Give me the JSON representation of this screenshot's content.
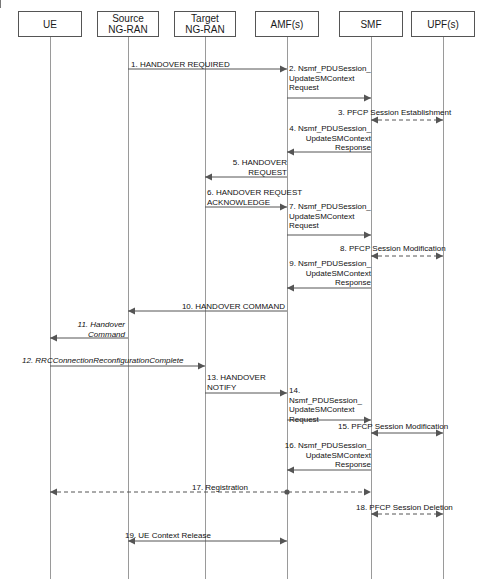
{
  "diagram": {
    "type": "sequence-diagram",
    "width": 491,
    "height": 579,
    "line_color": "#555555",
    "lifeline_color": "#9a9a9a",
    "text_color": "#111111"
  },
  "actors": [
    {
      "id": "ue",
      "label": "UE",
      "x": 50,
      "box_left": 18,
      "box_top": 11,
      "box_width": 64,
      "box_height": 26
    },
    {
      "id": "srcran",
      "label": "Source\nNG-RAN",
      "x": 128,
      "box_left": 97,
      "box_top": 11,
      "box_width": 62,
      "box_height": 26
    },
    {
      "id": "tgtran",
      "label": "Target\nNG-RAN",
      "x": 205,
      "box_left": 174,
      "box_top": 11,
      "box_width": 62,
      "box_height": 26
    },
    {
      "id": "amf",
      "label": "AMF(s)",
      "x": 287,
      "box_left": 255,
      "box_top": 11,
      "box_width": 64,
      "box_height": 26
    },
    {
      "id": "smf",
      "label": "SMF",
      "x": 371,
      "box_left": 339,
      "box_top": 11,
      "box_width": 64,
      "box_height": 26
    },
    {
      "id": "upf",
      "label": "UPF(s)",
      "x": 443,
      "box_left": 411,
      "box_top": 11,
      "box_width": 64,
      "box_height": 26
    }
  ],
  "messages": [
    {
      "seq": "1",
      "text": "1. HANDOVER REQUIRED",
      "from": "srcran",
      "to": "amf",
      "style": "solid",
      "direction": "forward",
      "arrow_y": 69,
      "label_x": 131,
      "label_y": 60,
      "label_w": 150,
      "label_align": "left",
      "italic": false
    },
    {
      "seq": "2",
      "text": "2. Nsmf_PDUSession_\nUpdateSMContext\nRequest",
      "from": "amf",
      "to": "smf",
      "style": "solid",
      "direction": "forward",
      "arrow_y": 98,
      "label_x": 289,
      "label_y": 64,
      "label_w": 82,
      "label_align": "left",
      "italic": false
    },
    {
      "seq": "3",
      "text": "3. PFCP Session Establishment",
      "from": "smf",
      "to": "upf",
      "style": "dashed",
      "direction": "both",
      "arrow_y": 120,
      "label_x": 338,
      "label_y": 108,
      "label_w": 150,
      "label_align": "left",
      "italic": false
    },
    {
      "seq": "4",
      "text": "4. Nsmf_PDUSession_\nUpdateSMContext\nResponse",
      "from": "smf",
      "to": "amf",
      "style": "solid",
      "direction": "backward",
      "arrow_y": 152,
      "label_x": 278,
      "label_y": 124,
      "label_w": 93,
      "label_align": "right",
      "italic": false
    },
    {
      "seq": "5",
      "text": "5. HANDOVER\nREQUEST",
      "from": "amf",
      "to": "tgtran",
      "style": "solid",
      "direction": "backward",
      "arrow_y": 177,
      "label_x": 207,
      "label_y": 158,
      "label_w": 80,
      "label_align": "right",
      "italic": false
    },
    {
      "seq": "6",
      "text": "6. HANDOVER REQUEST\nACKNOWLEDGE",
      "from": "tgtran",
      "to": "amf",
      "style": "solid",
      "direction": "forward",
      "arrow_y": 207,
      "label_x": 207,
      "label_y": 188,
      "label_w": 110,
      "label_align": "left",
      "italic": false
    },
    {
      "seq": "7",
      "text": "7. Nsmf_PDUSession_\nUpdateSMContext\nRequest",
      "from": "amf",
      "to": "smf",
      "style": "solid",
      "direction": "forward",
      "arrow_y": 235,
      "label_x": 289,
      "label_y": 202,
      "label_w": 84,
      "label_align": "left",
      "italic": false
    },
    {
      "seq": "8",
      "text": "8. PFCP Session Modification",
      "from": "smf",
      "to": "upf",
      "style": "dashed",
      "direction": "both",
      "arrow_y": 256,
      "label_x": 340,
      "label_y": 244,
      "label_w": 146,
      "label_align": "left",
      "italic": false
    },
    {
      "seq": "9",
      "text": "9. Nsmf_PDUSession_\nUpdateSMContext\nResponse",
      "from": "smf",
      "to": "amf",
      "style": "solid",
      "direction": "backward",
      "arrow_y": 288,
      "label_x": 278,
      "label_y": 259,
      "label_w": 93,
      "label_align": "right",
      "italic": false
    },
    {
      "seq": "10",
      "text": "10. HANDOVER COMMAND",
      "from": "amf",
      "to": "srcran",
      "style": "solid",
      "direction": "backward",
      "arrow_y": 311,
      "label_x": 160,
      "label_y": 302,
      "label_w": 125,
      "label_align": "right",
      "italic": false
    },
    {
      "seq": "11",
      "text": "11. Handover\nCommand",
      "from": "srcran",
      "to": "ue",
      "style": "solid",
      "direction": "backward",
      "arrow_y": 338,
      "label_x": 52,
      "label_y": 320,
      "label_w": 73,
      "label_align": "right",
      "italic": true
    },
    {
      "seq": "12",
      "text": "12. RRCConnectionReconfigurationComplete",
      "from": "ue",
      "to": "tgtran",
      "style": "solid",
      "direction": "forward",
      "arrow_y": 366,
      "label_x": 22,
      "label_y": 356,
      "label_w": 190,
      "label_align": "left",
      "italic": true
    },
    {
      "seq": "13",
      "text": "13. HANDOVER\nNOTIFY",
      "from": "tgtran",
      "to": "amf",
      "style": "solid",
      "direction": "forward",
      "arrow_y": 393,
      "label_x": 207,
      "label_y": 373,
      "label_w": 75,
      "label_align": "left",
      "italic": false
    },
    {
      "seq": "14",
      "text": "14. Nsmf_PDUSession_\nUpdateSMContext\nRequest",
      "from": "amf",
      "to": "smf",
      "style": "solid",
      "direction": "forward",
      "arrow_y": 420,
      "label_x": 289,
      "label_y": 386,
      "label_w": 86,
      "label_align": "left",
      "italic": false
    },
    {
      "seq": "15",
      "text": "15. PFCP Session Modification",
      "from": "smf",
      "to": "upf",
      "style": "solid",
      "direction": "both",
      "arrow_y": 433,
      "label_x": 338,
      "label_y": 422,
      "label_w": 148,
      "label_align": "left",
      "italic": false
    },
    {
      "seq": "16",
      "text": "16. Nsmf_PDUSession_\nUpdateSMContext\nResponse",
      "from": "smf",
      "to": "amf",
      "style": "solid",
      "direction": "backward",
      "arrow_y": 470,
      "label_x": 278,
      "label_y": 441,
      "label_w": 93,
      "label_align": "right",
      "italic": false
    },
    {
      "seq": "17",
      "text": "17. Registration",
      "from": "ue",
      "to": "smf",
      "style": "dashed",
      "direction": "both",
      "arrow_y": 492,
      "label_x": 175,
      "label_y": 483,
      "label_w": 90,
      "label_align": "center",
      "italic": false,
      "dots": [
        287
      ]
    },
    {
      "seq": "18",
      "text": "18. PFCP Session Deletion",
      "from": "smf",
      "to": "upf",
      "style": "dashed",
      "direction": "both",
      "arrow_y": 514,
      "label_x": 356,
      "label_y": 503,
      "label_w": 130,
      "label_align": "left",
      "italic": false
    },
    {
      "seq": "19",
      "text": "19. UE Context Release",
      "from": "srcran",
      "to": "amf",
      "style": "solid",
      "direction": "both",
      "arrow_y": 541,
      "label_x": 125,
      "label_y": 531,
      "label_w": 110,
      "label_align": "left",
      "italic": false
    }
  ]
}
